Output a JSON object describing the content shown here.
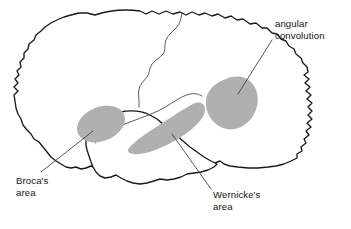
{
  "figure": {
    "background_color": "#ffffff",
    "outline_color": "#1a1a1a",
    "region_fill_color": "#b0b0b0",
    "leader_line_color": "#3c3c3c",
    "text_color": "#141414"
  },
  "labels": {
    "angular_convolution": {
      "line1": "angular",
      "line2": "convolution"
    },
    "brocas_area": {
      "line1": "Broca's",
      "line2": "area"
    },
    "wernickes_area": {
      "line1": "Wernicke's",
      "line2": "area"
    }
  },
  "regions": [
    {
      "name": "angular-convolution-region",
      "label": "angular convolution",
      "shape": "rounded-blob",
      "fill": "#b0b0b0"
    },
    {
      "name": "brocas-area-region",
      "label": "Broca's area",
      "shape": "tilted-ellipse",
      "fill": "#b0b0b0"
    },
    {
      "name": "wernickes-area-region",
      "label": "Wernicke's area",
      "shape": "elongated-band",
      "fill": "#b0b0b0"
    }
  ],
  "structures": [
    {
      "name": "cerebral-cortex-outline",
      "label": "cerebral cortex"
    },
    {
      "name": "temporal-lobe-outline",
      "label": "temporal lobe"
    },
    {
      "name": "central-sulcus-line",
      "label": "central sulcus"
    },
    {
      "name": "lateral-sulcus-line",
      "label": "lateral (Sylvian) fissure"
    }
  ]
}
